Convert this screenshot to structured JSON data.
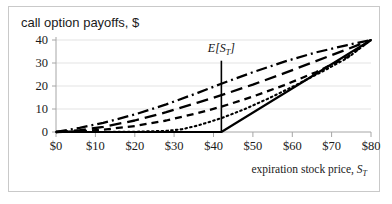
{
  "chart_title": "call option payoffs, $",
  "axes": {
    "x_title_main": "expiration stock price, ",
    "x_title_var": "S",
    "x_title_sub": "T",
    "y_ticks": [
      "0",
      "10",
      "20",
      "30",
      "40"
    ],
    "x_ticks": [
      "$0",
      "$10",
      "$20",
      "$30",
      "$40",
      "$50",
      "$60",
      "$70",
      "$80"
    ]
  },
  "annotation": {
    "label_main": "E[S",
    "label_sub": "T",
    "label_end": "]"
  },
  "colors": {
    "line": "#000000",
    "grid": "#e3e3e3",
    "axis": "#a6a6a6",
    "frame": "#c9c9c9",
    "text": "#1a1a1a",
    "background": "#ffffff"
  },
  "chart_data": {
    "type": "line",
    "title": "call option payoffs, $",
    "xlabel": "expiration stock price, S_T",
    "ylabel": "call option payoffs, $",
    "xlim": [
      0,
      80
    ],
    "ylim": [
      0,
      42
    ],
    "x_tick_values": [
      0,
      10,
      20,
      30,
      40,
      50,
      60,
      70,
      80
    ],
    "y_tick_values": [
      0,
      10,
      20,
      30,
      40
    ],
    "grid": "horizontal",
    "legend": "none",
    "annotations": [
      {
        "text": "E[S_T]",
        "type": "vertical-line-with-label",
        "x": 42,
        "y_top": 31,
        "y_bottom": 0,
        "label_x": 42,
        "label_y": 35
      }
    ],
    "series": [
      {
        "name": "payoff at expiration (intrinsic value)",
        "style": "solid",
        "x": [
          0,
          42,
          80
        ],
        "values": [
          0,
          0,
          40
        ]
      },
      {
        "name": "shortest time to maturity",
        "style": "dotted",
        "x": [
          0,
          10,
          20,
          28,
          32,
          36,
          42,
          48,
          54,
          60,
          68,
          74,
          80
        ],
        "values": [
          0,
          0,
          0.1,
          0.5,
          1.2,
          2.8,
          6.0,
          10.0,
          14.6,
          19.6,
          26.6,
          32.2,
          40.0
        ]
      },
      {
        "name": "medium-short time to maturity",
        "style": "dashed",
        "x": [
          0,
          6,
          12,
          20,
          28,
          36,
          42,
          50,
          58,
          66,
          74,
          80
        ],
        "values": [
          0,
          0.3,
          1.0,
          2.6,
          5.0,
          8.2,
          11.0,
          15.4,
          20.4,
          26.0,
          32.6,
          40.0
        ]
      },
      {
        "name": "medium-long time to maturity",
        "style": "long-dashed",
        "x": [
          0,
          6,
          12,
          20,
          28,
          36,
          42,
          50,
          58,
          66,
          74,
          80
        ],
        "values": [
          0,
          0.8,
          2.2,
          5.0,
          8.6,
          12.8,
          16.0,
          20.6,
          25.6,
          30.8,
          36.0,
          40.0
        ]
      },
      {
        "name": "longest time to maturity",
        "style": "dash-dot",
        "x": [
          0,
          6,
          12,
          20,
          28,
          36,
          42,
          50,
          58,
          66,
          74,
          80
        ],
        "values": [
          0,
          1.8,
          4.0,
          7.6,
          12.0,
          17.0,
          21.0,
          26.0,
          30.6,
          34.6,
          37.8,
          40.0
        ]
      }
    ]
  }
}
